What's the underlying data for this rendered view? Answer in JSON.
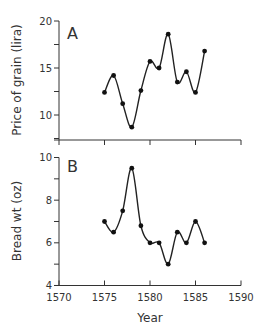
{
  "chart_data": [
    {
      "panel": "A",
      "type": "line",
      "title": "",
      "panel_label": "A",
      "xlabel": "",
      "ylabel": "Price of grain (lira)",
      "x": [
        1575,
        1576,
        1577,
        1578,
        1579,
        1580,
        1581,
        1582,
        1583,
        1584,
        1585,
        1586
      ],
      "values": [
        12.4,
        14.2,
        11.2,
        8.7,
        12.6,
        15.7,
        15.0,
        18.6,
        13.5,
        14.6,
        12.4,
        16.8
      ],
      "xlim": [
        1570,
        1590
      ],
      "ylim": [
        7.5,
        20
      ],
      "yticks": [
        10,
        15,
        20
      ],
      "xticks": [
        1570,
        1575,
        1580,
        1585,
        1590
      ],
      "show_xtick_labels": false,
      "grid": false,
      "smoothed": true
    },
    {
      "panel": "B",
      "type": "line",
      "title": "",
      "panel_label": "B",
      "xlabel": "Year",
      "ylabel": "Bread wt (oz)",
      "x": [
        1575,
        1576,
        1577,
        1578,
        1579,
        1580,
        1581,
        1582,
        1583,
        1584,
        1585,
        1586
      ],
      "values": [
        7.0,
        6.5,
        7.5,
        9.5,
        6.8,
        6.0,
        6.0,
        5.0,
        6.5,
        6.0,
        7.0,
        6.0
      ],
      "xlim": [
        1570,
        1590
      ],
      "ylim": [
        4,
        10
      ],
      "yticks": [
        4,
        6,
        8,
        10
      ],
      "xticks": [
        1570,
        1575,
        1580,
        1585,
        1590
      ],
      "show_xtick_labels": true,
      "grid": false,
      "smoothed": true
    }
  ],
  "labels": {
    "panel_a": "A",
    "panel_b": "B",
    "ylabel_a": "Price of grain (lira)",
    "ylabel_b": "Bread wt (oz)",
    "xlabel": "Year"
  }
}
